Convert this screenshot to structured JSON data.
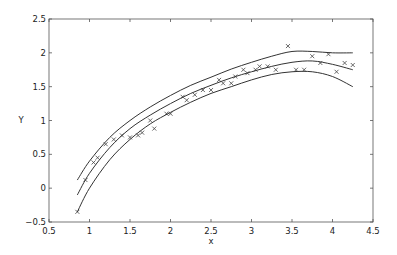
{
  "chart_data": {
    "type": "scatter",
    "title": "",
    "xlabel": "x",
    "ylabel": "Y",
    "xlim": [
      0.5,
      4.5
    ],
    "ylim": [
      -0.5,
      2.5
    ],
    "grid": false,
    "legend": null,
    "xticks": [
      "0.5",
      "1",
      "1.5",
      "2",
      "2.5",
      "3",
      "3.5",
      "4",
      "4.5"
    ],
    "yticks": [
      "-0.5",
      "0",
      "0.5",
      "1",
      "1.5",
      "2",
      "2.5"
    ],
    "series": [
      {
        "name": "data",
        "style": "markers-x",
        "x": [
          0.85,
          0.95,
          1.05,
          1.1,
          1.2,
          1.3,
          1.4,
          1.5,
          1.6,
          1.65,
          1.75,
          1.8,
          1.95,
          2.0,
          2.15,
          2.2,
          2.3,
          2.4,
          2.5,
          2.6,
          2.65,
          2.75,
          2.8,
          2.9,
          2.95,
          3.05,
          3.1,
          3.2,
          3.3,
          3.45,
          3.55,
          3.65,
          3.75,
          3.85,
          3.95,
          4.05,
          4.15,
          4.25
        ],
        "y": [
          -0.35,
          0.12,
          0.38,
          0.45,
          0.65,
          0.72,
          0.78,
          0.75,
          0.78,
          0.82,
          1.0,
          0.88,
          1.1,
          1.1,
          1.35,
          1.3,
          1.38,
          1.45,
          1.45,
          1.6,
          1.55,
          1.55,
          1.65,
          1.75,
          1.7,
          1.75,
          1.8,
          1.8,
          1.75,
          2.1,
          1.75,
          1.75,
          1.95,
          1.85,
          1.98,
          1.72,
          1.85,
          1.82
        ]
      },
      {
        "name": "fit",
        "style": "line",
        "x": [
          0.85,
          1.0,
          1.25,
          1.5,
          1.75,
          2.0,
          2.25,
          2.5,
          2.75,
          3.0,
          3.25,
          3.5,
          3.75,
          4.0,
          4.25
        ],
        "y": [
          -0.1,
          0.22,
          0.6,
          0.88,
          1.08,
          1.25,
          1.4,
          1.52,
          1.63,
          1.72,
          1.8,
          1.86,
          1.88,
          1.83,
          1.75
        ]
      },
      {
        "name": "upper bound",
        "style": "line",
        "x": [
          0.85,
          1.0,
          1.25,
          1.5,
          1.75,
          2.0,
          2.25,
          2.5,
          2.75,
          3.0,
          3.25,
          3.5,
          3.75,
          4.0,
          4.25
        ],
        "y": [
          0.12,
          0.4,
          0.75,
          1.0,
          1.2,
          1.37,
          1.52,
          1.64,
          1.76,
          1.86,
          1.95,
          2.02,
          2.02,
          2.0,
          2.0
        ]
      },
      {
        "name": "lower bound",
        "style": "line",
        "x": [
          0.85,
          1.0,
          1.25,
          1.5,
          1.75,
          2.0,
          2.25,
          2.5,
          2.75,
          3.0,
          3.25,
          3.5,
          3.75,
          4.0,
          4.25
        ],
        "y": [
          -0.35,
          0.0,
          0.42,
          0.72,
          0.95,
          1.12,
          1.27,
          1.4,
          1.5,
          1.6,
          1.68,
          1.72,
          1.72,
          1.65,
          1.5
        ]
      }
    ]
  }
}
